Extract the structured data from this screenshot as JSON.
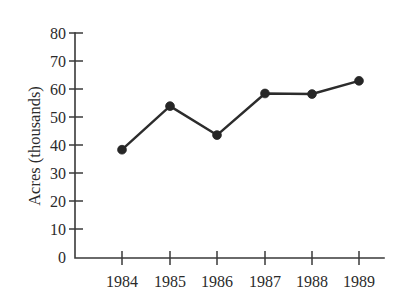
{
  "chart_data": {
    "type": "line",
    "title": "",
    "subtitle": "",
    "xlabel": "",
    "ylabel": "Acres (thousands)",
    "categories": [
      "1984",
      "1985",
      "1986",
      "1987",
      "1988",
      "1989"
    ],
    "x": [
      1984,
      1985,
      1986,
      1987,
      1988,
      1989
    ],
    "values": [
      38.5,
      54,
      43.7,
      58.5,
      58.3,
      63
    ],
    "series": [
      {
        "name": "Acres",
        "values": [
          38.5,
          54,
          43.7,
          58.5,
          58.3,
          63
        ]
      }
    ],
    "ylim": [
      0,
      80
    ],
    "ytick_labels": [
      "0",
      "10",
      "20",
      "30",
      "40",
      "50",
      "60",
      "70",
      "80"
    ],
    "ytick_values": [
      0,
      10,
      20,
      30,
      40,
      50,
      60,
      70,
      80
    ],
    "xtick_labels": [
      "1984",
      "1985",
      "1986",
      "1987",
      "1988",
      "1989"
    ],
    "grid": false,
    "legend": false,
    "legend_position": "none",
    "marker": "circle",
    "line_color": "#2c2c2c",
    "marker_color": "#262626",
    "axis_color": "#3a3a3a",
    "background_color": "#ffffff",
    "annotations": []
  },
  "axis": {
    "y_title": "Acres (thousands)"
  }
}
